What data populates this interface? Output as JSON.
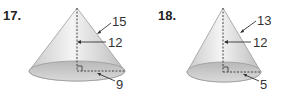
{
  "figures": [
    {
      "number": "17.",
      "slant_height": "15",
      "height": "12",
      "radius": "9"
    },
    {
      "number": "18.",
      "slant_height": "13",
      "height": "12",
      "radius": "5"
    }
  ],
  "colors": {
    "cone_light": "#f2f2f2",
    "cone_dark": "#bdbdbd",
    "base_fill": "#c8c8c8",
    "line": "#555555"
  }
}
